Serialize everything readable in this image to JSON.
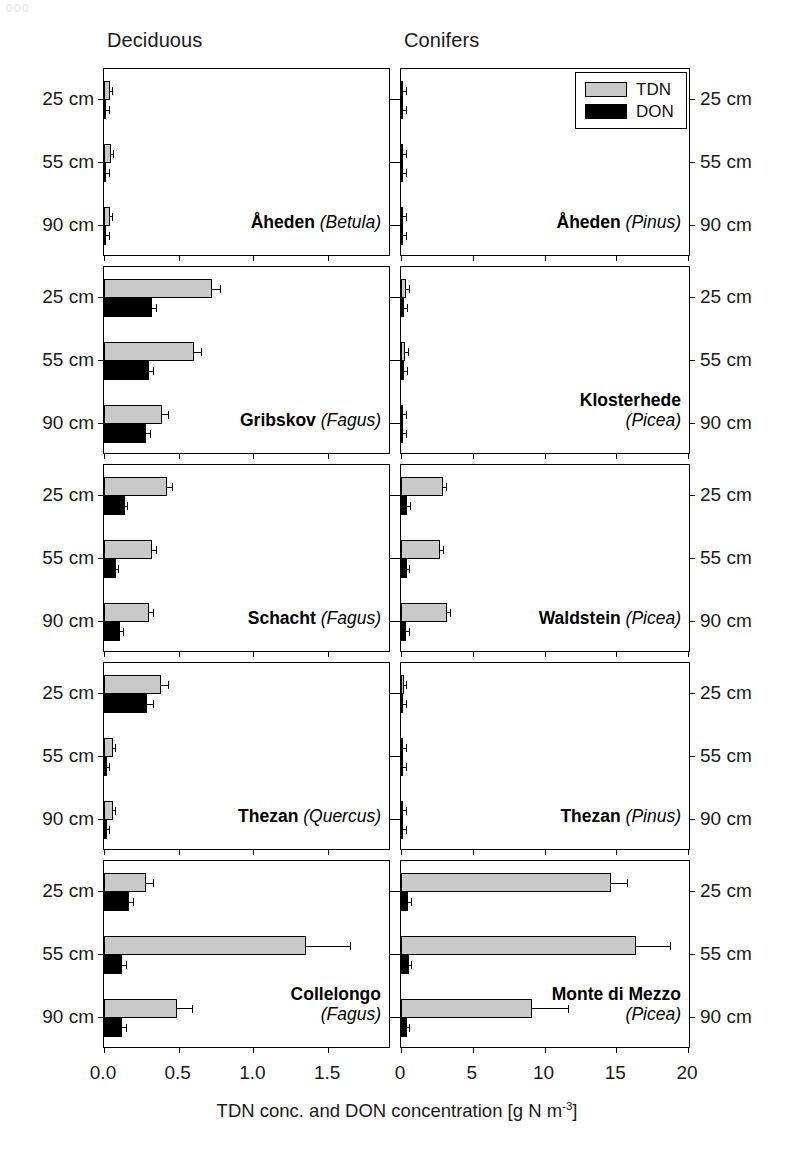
{
  "figure": {
    "column_headings": [
      "Deciduous",
      "Conifers"
    ],
    "depth_labels": [
      "25 cm",
      "55 cm",
      "90 cm"
    ],
    "axis_title_main": "TDN conc. and DON concentration [g N m",
    "axis_title_exponent": "-3",
    "axis_title_tail": "]",
    "legend": {
      "items": [
        {
          "key": "TDN",
          "label": "TDN",
          "color": "#c9c9c9"
        },
        {
          "key": "DON",
          "label": "DON",
          "color": "#000000"
        }
      ]
    },
    "page_smudge": "000"
  },
  "chart_data": {
    "type": "bar",
    "orientation": "horizontal",
    "xlabel": "TDN conc. and DON concentration [g N m-3]",
    "ylabel": "Soil depth",
    "categories": [
      "25 cm",
      "55 cm",
      "90 cm"
    ],
    "series_names": [
      "TDN",
      "DON"
    ],
    "grid": false,
    "legend_position": "top-right of upper-right panel",
    "columns": [
      {
        "name": "Deciduous",
        "xlim": [
          0,
          1.92
        ],
        "xticks": [
          0.0,
          0.5,
          1.0,
          1.5
        ],
        "xticklabels": [
          "0.0",
          "0.5",
          "1.0",
          "1.5"
        ]
      },
      {
        "name": "Conifers",
        "xlim": [
          0,
          20.2
        ],
        "xticks": [
          0,
          5,
          10,
          15,
          20
        ],
        "xticklabels": [
          "0",
          "5",
          "10",
          "15",
          "20"
        ]
      }
    ],
    "panels": [
      {
        "row": 0,
        "column": "Deciduous",
        "site": "Åheden",
        "species": "Betula",
        "series": [
          {
            "name": "TDN",
            "values": [
              0.04,
              0.045,
              0.038
            ],
            "errors": [
              0.008,
              0.01,
              0.008
            ]
          },
          {
            "name": "DON",
            "values": [
              0.01,
              0.012,
              0.009
            ],
            "errors": [
              0.004,
              0.004,
              0.003
            ]
          }
        ]
      },
      {
        "row": 0,
        "column": "Conifers",
        "site": "Åheden",
        "species": "Pinus",
        "series": [
          {
            "name": "TDN",
            "values": [
              0.07,
              0.09,
              0.06
            ],
            "errors": [
              0.02,
              0.05,
              0.02
            ]
          },
          {
            "name": "DON",
            "values": [
              0.03,
              0.04,
              0.02
            ],
            "errors": [
              0.01,
              0.02,
              0.01
            ]
          }
        ]
      },
      {
        "row": 1,
        "column": "Deciduous",
        "site": "Gribskov",
        "species": "Fagus",
        "series": [
          {
            "name": "TDN",
            "values": [
              0.72,
              0.6,
              0.39
            ],
            "errors": [
              0.06,
              0.05,
              0.04
            ]
          },
          {
            "name": "DON",
            "values": [
              0.32,
              0.3,
              0.28
            ],
            "errors": [
              0.03,
              0.03,
              0.03
            ]
          }
        ]
      },
      {
        "row": 1,
        "column": "Conifers",
        "site": "Klosterhede",
        "species": "Picea",
        "series": [
          {
            "name": "TDN",
            "values": [
              0.36,
              0.3,
              0.05
            ],
            "errors": [
              0.06,
              0.05,
              0.02
            ]
          },
          {
            "name": "DON",
            "values": [
              0.24,
              0.21,
              0.03
            ],
            "errors": [
              0.04,
              0.04,
              0.01
            ]
          }
        ]
      },
      {
        "row": 2,
        "column": "Deciduous",
        "site": "Schacht",
        "species": "Fagus",
        "series": [
          {
            "name": "TDN",
            "values": [
              0.42,
              0.32,
              0.3
            ],
            "errors": [
              0.04,
              0.03,
              0.03
            ]
          },
          {
            "name": "DON",
            "values": [
              0.14,
              0.08,
              0.11
            ],
            "errors": [
              0.02,
              0.01,
              0.02
            ]
          }
        ]
      },
      {
        "row": 2,
        "column": "Conifers",
        "site": "Waldstein",
        "species": "Picea",
        "series": [
          {
            "name": "TDN",
            "values": [
              2.9,
              2.75,
              3.2
            ],
            "errors": [
              0.25,
              0.22,
              0.28
            ]
          },
          {
            "name": "DON",
            "values": [
              0.45,
              0.4,
              0.35
            ],
            "errors": [
              0.06,
              0.05,
              0.05
            ]
          }
        ]
      },
      {
        "row": 3,
        "column": "Deciduous",
        "site": "Thezan",
        "species": "Quercus",
        "series": [
          {
            "name": "TDN",
            "values": [
              0.38,
              0.06,
              0.06
            ],
            "errors": [
              0.05,
              0.01,
              0.01
            ]
          },
          {
            "name": "DON",
            "values": [
              0.29,
              0.02,
              0.02
            ],
            "errors": [
              0.04,
              0.01,
              0.01
            ]
          }
        ]
      },
      {
        "row": 3,
        "column": "Conifers",
        "site": "Thezan",
        "species": "Pinus",
        "series": [
          {
            "name": "TDN",
            "values": [
              0.2,
              0.16,
              0.05
            ],
            "errors": [
              0.05,
              0.06,
              0.02
            ]
          },
          {
            "name": "DON",
            "values": [
              0.15,
              0.05,
              0.02
            ],
            "errors": [
              0.04,
              0.02,
              0.01
            ]
          }
        ]
      },
      {
        "row": 4,
        "column": "Deciduous",
        "site": "Collelongo",
        "species": "Fagus",
        "series": [
          {
            "name": "TDN",
            "values": [
              0.28,
              1.35,
              0.49
            ],
            "errors": [
              0.05,
              0.3,
              0.1
            ]
          },
          {
            "name": "DON",
            "values": [
              0.17,
              0.12,
              0.12
            ],
            "errors": [
              0.03,
              0.03,
              0.03
            ]
          }
        ]
      },
      {
        "row": 4,
        "column": "Conifers",
        "site": "Monte di Mezzo",
        "species": "Picea",
        "series": [
          {
            "name": "TDN",
            "values": [
              14.6,
              16.4,
              9.1
            ],
            "errors": [
              1.2,
              2.4,
              2.6
            ]
          },
          {
            "name": "DON",
            "values": [
              0.5,
              0.55,
              0.4
            ],
            "errors": [
              0.15,
              0.2,
              0.15
            ]
          }
        ]
      }
    ]
  }
}
